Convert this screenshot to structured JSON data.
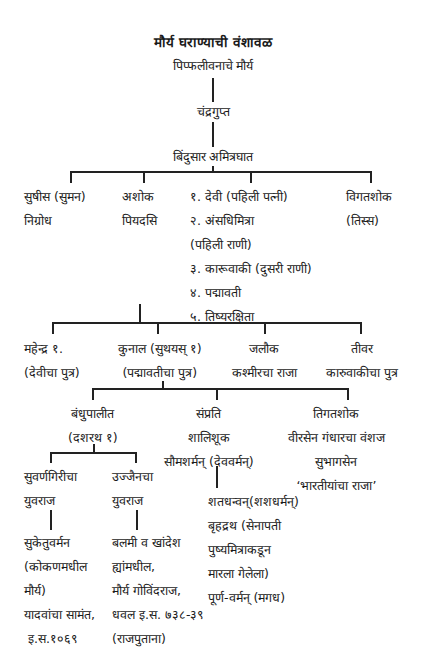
{
  "title": "मौर्य घराण्याची वंशावळ",
  "origin": "पिप्फलीवनाचे मौर्य",
  "gen1": "चंद्रगुप्त",
  "gen2": "बिंदुसार अमित्रघात",
  "gen3": {
    "susima": [
      "सुषीस (सुमन)",
      "निग्रोध"
    ],
    "ashoka": [
      "अशोक",
      "पियदसि"
    ],
    "queens": [
      "१. देवी (पहिली पत्नी)",
      "२. अंसधिमित्रा",
      "(पहिली राणी)",
      "३. कारूवाकी (दुसरी राणी)",
      "४. पद्मावती",
      "५. तिष्यरक्षिता"
    ],
    "vigatashoka": [
      "विगतशोक",
      "(तिस्स)"
    ]
  },
  "gen4": {
    "mahendra": [
      "महेन्द्र १.",
      "(देवीचा पुत्र)"
    ],
    "kunala": [
      "कुनाल (सुथयस् १)",
      "(पद्मावतीचा पुत्र)"
    ],
    "jalauka": [
      "जलौक",
      "कश्मीरचा राजा"
    ],
    "tivara": [
      "तीवर",
      "कारुवाकीचा पुत्र"
    ]
  },
  "gen5": {
    "bandhupalita": [
      "बंधुपालीत",
      "(दशरथ १)"
    ],
    "samprati": [
      "संप्रति",
      "शालिशूक",
      "सौमशर्मन् (देववर्मन्)"
    ],
    "tigatashoka": [
      "तिगतशोक",
      "वीरसेन गंधारचा वंशज",
      "सुभागसेन",
      "‘भारतीयांचा राजा’"
    ]
  },
  "gen6": {
    "suvarnagiri": [
      "सुवर्णगिरीचा",
      "युवराज"
    ],
    "ujjain": [
      "उज्जैनचा",
      "युवराज"
    ]
  },
  "gen7": {
    "suketuvarman": [
      "सुकेतुवर्मन",
      "(कोकणमधील",
      "मौर्य)",
      "यादवांचा सामंत,",
      " इ.स.१०६९"
    ],
    "balami": [
      "बलमी व खांदेश",
      "ह्यांमधील,",
      "मौर्य गोविंदराज,",
      "धवल इ.स. ७३८-३९",
      "(राजपुताना)"
    ],
    "shatadhanvan": [
      "शतधन्वन्(शशधर्मन्)",
      "बृहद्रथ (सेनापती",
      "पुष्यमित्राकडून",
      "मारला गेलेला)",
      "पूर्ण-वर्मन् (मगध)"
    ]
  }
}
